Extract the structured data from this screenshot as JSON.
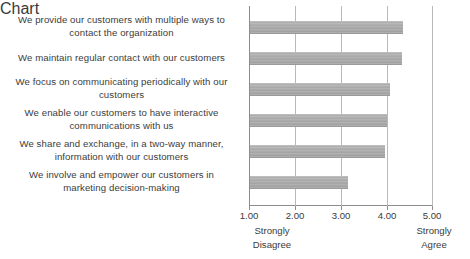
{
  "chart_data": {
    "type": "bar",
    "orientation": "horizontal",
    "title": "",
    "subtitle": "",
    "xlabel": "",
    "ylabel": "",
    "xlim": [
      1.0,
      5.0
    ],
    "grid": true,
    "legend": false,
    "legend_position": "none",
    "bar_color": "#a9a9a9",
    "categories": [
      "We provide our customers with multiple ways to contact the organization",
      "We maintain regular contact with our customers",
      "We focus on communicating periodically with our customers",
      "We enable our customers to have interactive communications with us",
      "We share and exchange, in a two-way manner, information with our customers",
      "We involve and empower our customers in marketing decision-making"
    ],
    "values": [
      4.35,
      4.33,
      4.05,
      4.0,
      3.95,
      3.15
    ],
    "xticks": [
      1.0,
      2.0,
      3.0,
      4.0,
      5.0
    ],
    "xticklabels": [
      "1.00",
      "2.00",
      "3.00",
      "4.00",
      "5.00"
    ],
    "scale_anchor_low": "Strongly\nDisagree",
    "scale_anchor_high": "Strongly\nAgree"
  },
  "labels": {
    "cat0_line1": "We provide our customers with multiple ways to",
    "cat0_line2": "contact the organization",
    "cat1_line1": "We maintain regular contact with our customers",
    "cat2_line1": "We focus on communicating periodically with our",
    "cat2_line2": "customers",
    "cat3_line1": "We enable our customers to have interactive",
    "cat3_line2": "communications with us",
    "cat4_line1": "We share and exchange, in a two-way manner,",
    "cat4_line2": "information with our customers",
    "cat5_line1": "We involve and empower our customers in",
    "cat5_line2": "marketing decision-making"
  },
  "axis": {
    "tick_1": "1.00",
    "tick_2": "2.00",
    "tick_3": "3.00",
    "tick_4": "4.00",
    "tick_5": "5.00",
    "anchor_low_line1": "Strongly",
    "anchor_low_line2": "Disagree",
    "anchor_high_line1": "Strongly",
    "anchor_high_line2": "Agree"
  }
}
